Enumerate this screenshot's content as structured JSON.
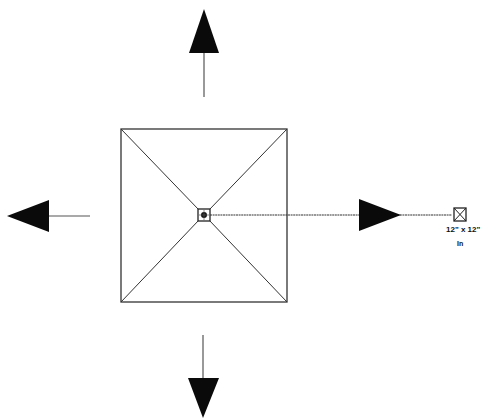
{
  "diagram": {
    "type": "plan-symbol",
    "colors": {
      "stroke": "#222222",
      "fill": "#0a0a0a",
      "background": "#ffffff"
    },
    "arrows": [
      {
        "direction": "up"
      },
      {
        "direction": "down"
      },
      {
        "direction": "left"
      },
      {
        "direction": "right"
      }
    ],
    "center_symbol": "crosshair-box-icon",
    "callout": {
      "symbol": "boxed-x-icon",
      "size_text": "12\" x 12\"",
      "unit_text": "In"
    }
  }
}
